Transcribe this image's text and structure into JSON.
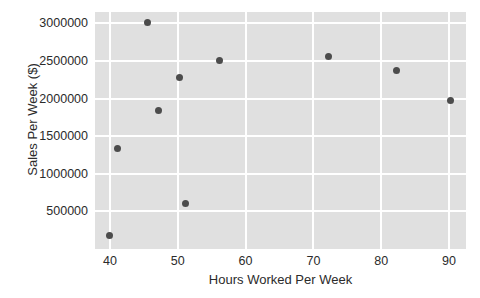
{
  "chart_data": {
    "type": "scatter",
    "title": "",
    "xlabel": "Hours Worked Per Week",
    "ylabel": "Sales Per Week ($)",
    "xlim": [
      37.8,
      92.5
    ],
    "ylim": [
      0,
      3150000
    ],
    "grid": true,
    "legend": null,
    "xticks": [
      40,
      50,
      60,
      70,
      80,
      90
    ],
    "xtick_labels": [
      "40",
      "50",
      "60",
      "70",
      "80",
      "90"
    ],
    "yticks": [
      500000,
      1000000,
      1500000,
      2000000,
      2500000,
      3000000
    ],
    "ytick_labels": [
      "500000",
      "1000000",
      "1500000",
      "2000000",
      "2500000",
      "3000000"
    ],
    "marker": "circle",
    "marker_color": "#4c4c4c",
    "plot_background": "#e0e0e0",
    "gridline_color": "#ffffff",
    "points": [
      {
        "x": 40.0,
        "y": 180000
      },
      {
        "x": 41.1,
        "y": 1330000
      },
      {
        "x": 45.5,
        "y": 3005000
      },
      {
        "x": 47.2,
        "y": 1845000
      },
      {
        "x": 50.3,
        "y": 2285000
      },
      {
        "x": 51.1,
        "y": 610000
      },
      {
        "x": 56.2,
        "y": 2500000
      },
      {
        "x": 72.2,
        "y": 2560000
      },
      {
        "x": 82.3,
        "y": 2375000
      },
      {
        "x": 90.2,
        "y": 1970000
      }
    ]
  }
}
